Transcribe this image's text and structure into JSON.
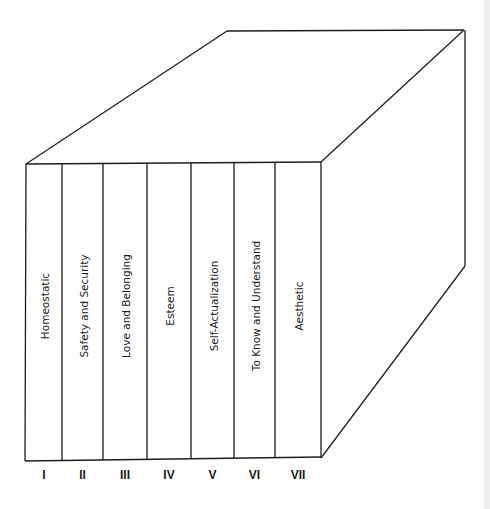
{
  "figure": {
    "type": "3d-box-diagram",
    "columns": [
      {
        "numeral": "I",
        "label": "Homeostatic"
      },
      {
        "numeral": "II",
        "label": "Safety and Security"
      },
      {
        "numeral": "III",
        "label": "Love and Belonging"
      },
      {
        "numeral": "IV",
        "label": "Esteem"
      },
      {
        "numeral": "V",
        "label": "Self-Actualization"
      },
      {
        "numeral": "VI",
        "label": "To Know and Understand"
      },
      {
        "numeral": "VII",
        "label": "Aesthetic"
      }
    ],
    "line_color": "#1e1e1e",
    "background_color": "#ffffff"
  }
}
